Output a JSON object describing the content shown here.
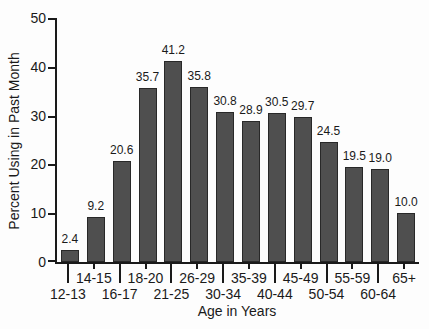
{
  "figure": {
    "background_color": "#fdfdfd",
    "text_color": "#1a1a1a",
    "axis_color": "#1a1a1a"
  },
  "chart_data": {
    "type": "bar",
    "title": "",
    "xlabel": "Age in Years",
    "ylabel": "Percent Using in Past Month",
    "categories": [
      "12-13",
      "14-15",
      "16-17",
      "18-20",
      "21-25",
      "26-29",
      "30-34",
      "35-39",
      "40-44",
      "45-49",
      "50-54",
      "55-59",
      "60-64",
      "65+"
    ],
    "values": [
      2.4,
      9.2,
      20.6,
      35.7,
      41.2,
      35.8,
      30.8,
      28.9,
      30.5,
      29.7,
      24.5,
      19.5,
      19.0,
      10.0
    ],
    "value_labels": [
      "2.4",
      "9.2",
      "20.6",
      "35.7",
      "41.2",
      "35.8",
      "30.8",
      "28.9",
      "30.5",
      "29.7",
      "24.5",
      "19.5",
      "19.0",
      "10.0"
    ],
    "ylim": [
      0,
      50
    ],
    "yticks": [
      0,
      10,
      20,
      30,
      40,
      50
    ],
    "grid": false,
    "legend": "none",
    "bar_color": "#4f4f4f",
    "bar_border_color": "#282828",
    "x_label_layout": "staggered: even-index labels in lower row with long ticks, odd-index labels in upper row with short ticks"
  }
}
